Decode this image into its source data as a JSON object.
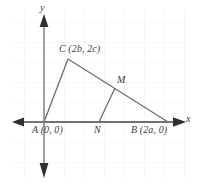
{
  "figure": {
    "type": "coordinate-geometry-diagram",
    "background_color": "#ffffff",
    "grid_color": "#f0eef0",
    "axis_color": "#4a4a4a",
    "shape_color": "#6e6e6e",
    "text_color": "#3b3b3b"
  },
  "axes": {
    "x_label": "x",
    "y_label": "y",
    "origin_px": {
      "x": 44,
      "y": 122
    },
    "x_axis_px": {
      "x1": 12,
      "x2": 186,
      "y": 122
    },
    "y_axis_px": {
      "y1": 14,
      "y2": 178,
      "x": 44
    },
    "arrowheads": [
      "left",
      "right",
      "up",
      "down"
    ]
  },
  "grid": {
    "visible": true,
    "spacing_px": 20,
    "left_px": 12,
    "top_px": 12,
    "right_px": 186,
    "bottom_px": 178
  },
  "points": [
    {
      "id": "A",
      "label": "A (0, 0)",
      "name": "A",
      "coords": "(0, 0)",
      "px": {
        "x": 44,
        "y": 122
      },
      "label_px": {
        "x": 32,
        "y": 125
      }
    },
    {
      "id": "C",
      "label": "C (2b, 2c)",
      "name": "C",
      "coords": "(2b, 2c)",
      "px": {
        "x": 68,
        "y": 59
      },
      "label_px": {
        "x": 59,
        "y": 44
      }
    },
    {
      "id": "B",
      "label": "B (2a, 0)",
      "name": "B",
      "coords": "(2a, 0)",
      "px": {
        "x": 168,
        "y": 122
      },
      "label_px": {
        "x": 131,
        "y": 125
      }
    },
    {
      "id": "M",
      "label": "M",
      "name": "M",
      "coords": "",
      "px": {
        "x": 115,
        "y": 88
      },
      "label_px": {
        "x": 117,
        "y": 75
      }
    },
    {
      "id": "N",
      "label": "N",
      "name": "N",
      "coords": "",
      "px": {
        "x": 99,
        "y": 122
      },
      "label_px": {
        "x": 94,
        "y": 125
      }
    }
  ],
  "segments": [
    {
      "id": "AC",
      "from": "A",
      "to": "C"
    },
    {
      "id": "CB",
      "from": "C",
      "to": "B"
    },
    {
      "id": "AB",
      "from": "A",
      "to": "B"
    },
    {
      "id": "MN",
      "from": "M",
      "to": "N"
    }
  ]
}
